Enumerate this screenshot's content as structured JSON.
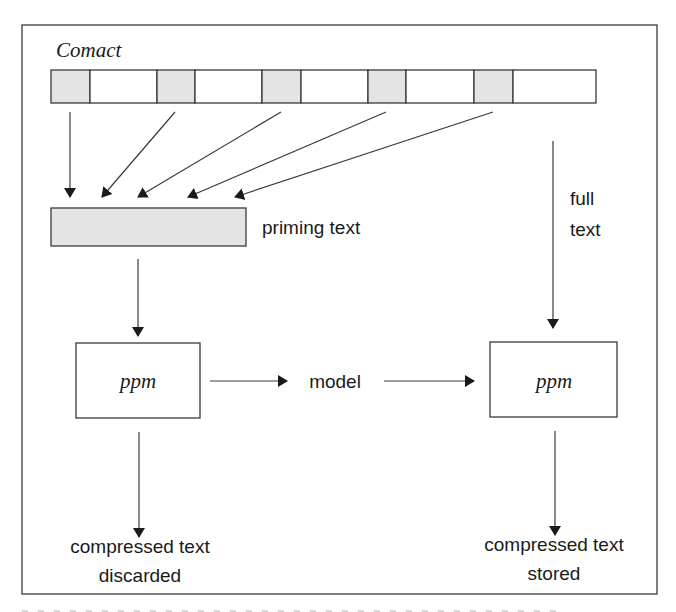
{
  "diagram": {
    "title": "Comact",
    "colors": {
      "stroke": "#3a3a3a",
      "shade": "#e4e4e4",
      "text": "#1a1a1a",
      "background": "#ffffff"
    },
    "frame": {
      "x": 22,
      "y": 25,
      "w": 635,
      "h": 569
    },
    "strip": {
      "y": 70,
      "h": 33,
      "cells": [
        {
          "x0": 51,
          "x1": 90,
          "shaded": true
        },
        {
          "x0": 90,
          "x1": 157,
          "shaded": false
        },
        {
          "x0": 157,
          "x1": 195,
          "shaded": true
        },
        {
          "x0": 195,
          "x1": 262,
          "shaded": false
        },
        {
          "x0": 262,
          "x1": 301,
          "shaded": true
        },
        {
          "x0": 301,
          "x1": 368,
          "shaded": false
        },
        {
          "x0": 368,
          "x1": 406,
          "shaded": true
        },
        {
          "x0": 406,
          "x1": 474,
          "shaded": false
        },
        {
          "x0": 474,
          "x1": 513,
          "shaded": true
        },
        {
          "x0": 513,
          "x1": 596,
          "shaded": false
        }
      ]
    },
    "priming_box": {
      "x": 51,
      "y": 208,
      "w": 195,
      "h": 38,
      "label": "priming text"
    },
    "full_text_label": [
      "full",
      "text"
    ],
    "ppm_left": {
      "x": 76,
      "y": 343,
      "w": 124,
      "h": 75,
      "label": "ppm"
    },
    "ppm_right": {
      "x": 490,
      "y": 342,
      "w": 127,
      "h": 75,
      "label": "ppm"
    },
    "model_label": "model",
    "output_left": [
      "compressed text",
      "discarded"
    ],
    "output_right": [
      "compressed text",
      "stored"
    ],
    "arrows": [
      {
        "id": "cell1-to-priming",
        "x1": 70,
        "y1": 112,
        "x2": 70,
        "y2": 197
      },
      {
        "id": "cell2-to-priming",
        "x1": 175,
        "y1": 112,
        "x2": 102,
        "y2": 197
      },
      {
        "id": "cell3-to-priming",
        "x1": 281,
        "y1": 112,
        "x2": 138,
        "y2": 197
      },
      {
        "id": "cell4-to-priming",
        "x1": 386,
        "y1": 112,
        "x2": 188,
        "y2": 197
      },
      {
        "id": "cell5-to-priming",
        "x1": 493,
        "y1": 112,
        "x2": 235,
        "y2": 197
      },
      {
        "id": "full-text",
        "x1": 553,
        "y1": 141,
        "x2": 553,
        "y2": 328
      },
      {
        "id": "priming-to-ppm",
        "x1": 138,
        "y1": 259,
        "x2": 138,
        "y2": 336
      },
      {
        "id": "ppm-to-model",
        "x1": 210,
        "y1": 381,
        "x2": 287,
        "y2": 381
      },
      {
        "id": "model-to-ppm",
        "x1": 384,
        "y1": 381,
        "x2": 474,
        "y2": 381
      },
      {
        "id": "ppm-left-out",
        "x1": 139,
        "y1": 432,
        "x2": 139,
        "y2": 537
      },
      {
        "id": "ppm-right-out",
        "x1": 555,
        "y1": 431,
        "x2": 555,
        "y2": 535
      }
    ]
  }
}
